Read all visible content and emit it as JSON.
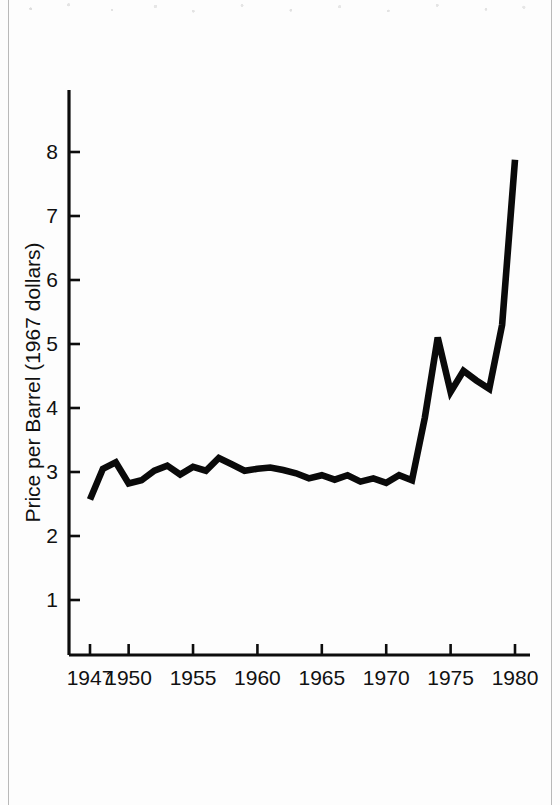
{
  "figure": {
    "background_color": "#fdfdfd",
    "ink_color": "#0a0a0a",
    "frame_color": "#b9b9b9"
  },
  "chart_data": {
    "type": "line",
    "title": "",
    "subtitle": "",
    "xlabel": "",
    "ylabel": "Price per Barrel (1967 dollars)",
    "xlim": [
      1947,
      1980
    ],
    "ylim": [
      0,
      8.6
    ],
    "grid": false,
    "legend": null,
    "annotations": [],
    "x_tick_labels": [
      "1947",
      "1950",
      "1955",
      "1960",
      "1965",
      "1970",
      "1975",
      "1980"
    ],
    "x_tick_values": [
      1947,
      1950,
      1955,
      1960,
      1965,
      1970,
      1975,
      1980
    ],
    "x_minor_ticks": [
      1947,
      1950,
      1955,
      1960,
      1965,
      1970,
      1975,
      1980
    ],
    "y_tick_labels": [
      "1",
      "2",
      "3",
      "4",
      "5",
      "6",
      "7",
      "8"
    ],
    "y_tick_values": [
      1,
      2,
      3,
      4,
      5,
      6,
      7,
      8
    ],
    "series": [
      {
        "name": "Price per Barrel (1967 dollars)",
        "color": "#0a0a0a",
        "x": [
          1947,
          1948,
          1949,
          1950,
          1951,
          1952,
          1953,
          1954,
          1955,
          1956,
          1957,
          1958,
          1959,
          1960,
          1961,
          1962,
          1963,
          1964,
          1965,
          1966,
          1967,
          1968,
          1969,
          1970,
          1971,
          1972,
          1973,
          1974,
          1975,
          1976,
          1977,
          1978,
          1979,
          1980
        ],
        "values": [
          2.57,
          3.05,
          3.15,
          2.82,
          2.87,
          3.02,
          3.1,
          2.96,
          3.08,
          3.02,
          3.22,
          3.12,
          3.02,
          3.05,
          3.07,
          3.03,
          2.98,
          2.9,
          2.95,
          2.88,
          2.95,
          2.85,
          2.9,
          2.83,
          2.95,
          2.87,
          3.85,
          5.1,
          4.25,
          4.58,
          4.43,
          4.3,
          5.3,
          7.88
        ]
      }
    ]
  },
  "axis_geometry": {
    "plot_left_px": 69,
    "plot_bottom_px": 655,
    "x_1947_px": 90,
    "x_1980_px": 515,
    "y_value_1_px": 600,
    "y_value_8_px": 152,
    "axis_top_px": 90,
    "axis_right_px": 530
  }
}
